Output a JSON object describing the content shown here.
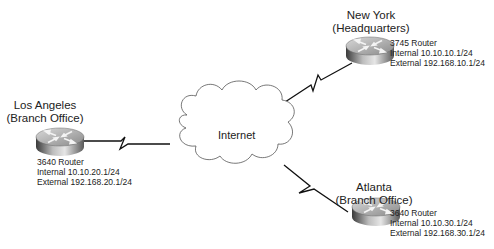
{
  "diagram": {
    "cloud": {
      "label": "Internet"
    },
    "sites": [
      {
        "name": "Los Angeles",
        "role": "(Branch Office)",
        "router_model": "3640 Router",
        "internal": "Internal 10.10.20.1/24",
        "external": "External 192.168.20.1/24"
      },
      {
        "name": "New York",
        "role": "(Headquarters)",
        "router_model": "3745 Router",
        "internal": "Internal 10.10.10.1/24",
        "external": "External 192.168.10.1/24"
      },
      {
        "name": "Atlanta",
        "role": "(Branch Office)",
        "router_model": "3640 Router",
        "internal": "Internal 10.10.30.1/24",
        "external": "External 192.168.30.1/24"
      }
    ],
    "links": [
      {
        "from": "Los Angeles",
        "to": "Internet",
        "type": "serial-wan"
      },
      {
        "from": "New York",
        "to": "Internet",
        "type": "serial-wan"
      },
      {
        "from": "Atlanta",
        "to": "Internet",
        "type": "serial-wan"
      }
    ]
  }
}
